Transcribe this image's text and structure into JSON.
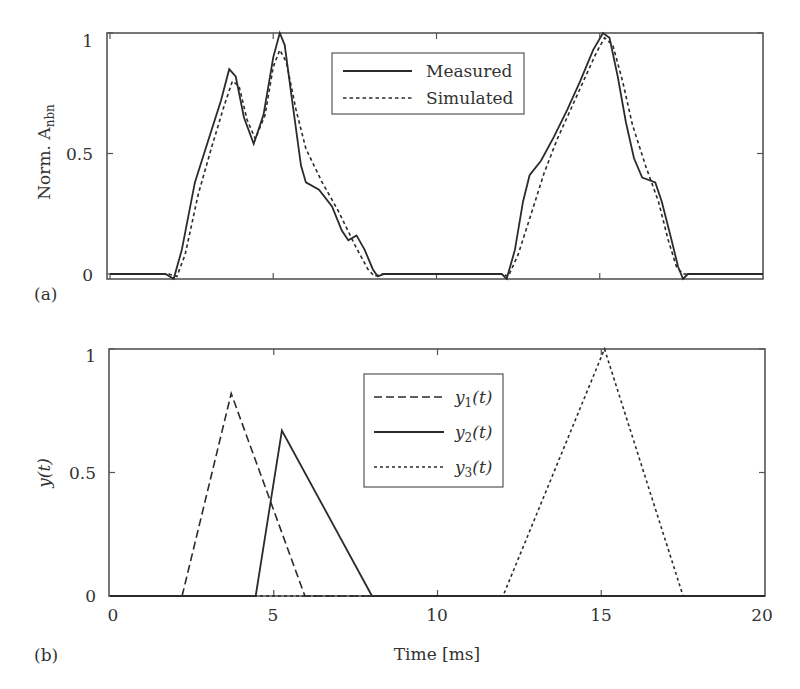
{
  "chart_data": [
    {
      "panel": "(a)",
      "type": "line",
      "title": "",
      "xlabel": "",
      "ylabel": "Norm. A_nbn",
      "ylabel_main": "Norm. A",
      "ylabel_sub": "nbn",
      "xlim": [
        0,
        20
      ],
      "ylim": [
        -0.02,
        1.0
      ],
      "yticks": [
        0,
        0.5,
        1
      ],
      "ytick_labels": [
        "0",
        "0.5",
        "1"
      ],
      "xticks": [
        0,
        5,
        10,
        15,
        20
      ],
      "xtick_labels": [],
      "grid": false,
      "legend_position": "upper center",
      "series": [
        {
          "name": "Measured",
          "style": "solid",
          "x": [
            0,
            1.7,
            1.95,
            2.2,
            2.6,
            3.0,
            3.4,
            3.65,
            3.85,
            4.1,
            4.4,
            4.7,
            5.0,
            5.2,
            5.35,
            5.6,
            5.85,
            6.0,
            6.4,
            6.8,
            7.1,
            7.3,
            7.55,
            7.8,
            8.05,
            8.2,
            8.4,
            12.0,
            12.15,
            12.4,
            12.65,
            12.85,
            13.2,
            13.6,
            14.0,
            14.4,
            14.8,
            15.1,
            15.3,
            15.55,
            15.8,
            16.05,
            16.3,
            16.7,
            16.9,
            17.2,
            17.4,
            17.55,
            17.7,
            20
          ],
          "y": [
            0.0,
            0.0,
            -0.02,
            0.1,
            0.38,
            0.55,
            0.72,
            0.85,
            0.82,
            0.65,
            0.54,
            0.66,
            0.9,
            1.0,
            0.95,
            0.7,
            0.45,
            0.38,
            0.35,
            0.28,
            0.18,
            0.14,
            0.16,
            0.1,
            0.02,
            -0.01,
            0.0,
            0.0,
            -0.02,
            0.1,
            0.3,
            0.41,
            0.47,
            0.57,
            0.68,
            0.8,
            0.93,
            1.0,
            0.98,
            0.82,
            0.63,
            0.48,
            0.4,
            0.38,
            0.3,
            0.14,
            0.03,
            -0.02,
            0.0,
            0.0
          ]
        },
        {
          "name": "Simulated",
          "style": "dotted",
          "x": [
            0,
            1.8,
            2.05,
            2.3,
            2.7,
            3.1,
            3.5,
            3.75,
            3.95,
            4.2,
            4.45,
            4.75,
            5.0,
            5.2,
            5.4,
            5.7,
            6.0,
            6.5,
            7.0,
            7.5,
            7.9,
            8.1,
            8.3,
            12.0,
            12.2,
            12.5,
            12.9,
            13.3,
            13.7,
            14.1,
            14.5,
            14.9,
            15.15,
            15.4,
            15.7,
            16.0,
            16.4,
            16.8,
            17.1,
            17.35,
            17.55,
            20
          ],
          "y": [
            0.0,
            0.0,
            -0.01,
            0.08,
            0.33,
            0.52,
            0.7,
            0.8,
            0.78,
            0.64,
            0.56,
            0.66,
            0.86,
            0.93,
            0.88,
            0.68,
            0.52,
            0.38,
            0.26,
            0.12,
            0.02,
            -0.01,
            0.0,
            0.0,
            -0.01,
            0.08,
            0.25,
            0.42,
            0.56,
            0.68,
            0.8,
            0.92,
            0.98,
            0.95,
            0.8,
            0.62,
            0.45,
            0.3,
            0.14,
            0.03,
            0.0,
            0.0
          ]
        }
      ]
    },
    {
      "panel": "(b)",
      "type": "line",
      "title": "",
      "xlabel": "Time [ms]",
      "ylabel": "y(t)",
      "xlim": [
        0,
        20
      ],
      "ylim": [
        0,
        1
      ],
      "xticks": [
        0,
        5,
        10,
        15,
        20
      ],
      "xtick_labels": [
        "0",
        "5",
        "10",
        "15",
        "20"
      ],
      "yticks": [
        0,
        0.5,
        1
      ],
      "ytick_labels": [
        "0",
        "0.5",
        "1"
      ],
      "grid": false,
      "legend_position": "upper center",
      "series": [
        {
          "name": "y1(t)",
          "label_base": "y",
          "label_sub": "1",
          "label_arg": "(t)",
          "style": "dashed",
          "x": [
            0,
            2.2,
            3.7,
            5.95,
            20
          ],
          "y": [
            0,
            0,
            0.82,
            0,
            0
          ]
        },
        {
          "name": "y2(t)",
          "label_base": "y",
          "label_sub": "2",
          "label_arg": "(t)",
          "style": "solid",
          "x": [
            0,
            4.45,
            5.25,
            8.0,
            20
          ],
          "y": [
            0,
            0,
            0.67,
            0,
            0
          ]
        },
        {
          "name": "y3(t)",
          "label_base": "y",
          "label_sub": "3",
          "label_arg": "(t)",
          "style": "dotted",
          "x": [
            0,
            12.0,
            15.1,
            17.5,
            20
          ],
          "y": [
            0,
            0,
            1.0,
            0,
            0
          ]
        }
      ]
    }
  ],
  "labels": {
    "panel_a_tag": "(a)",
    "panel_b_tag": "(b)",
    "legend_a": [
      "Measured",
      "Simulated"
    ]
  },
  "colors": {
    "line": "#2b2b2b",
    "axis": "#555555"
  }
}
